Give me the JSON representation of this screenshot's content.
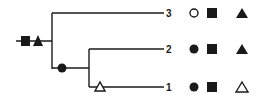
{
  "diagram": {
    "type": "cladogram",
    "colors": {
      "ink": "#1a1a1a",
      "background": "#ffffff"
    },
    "root": {
      "characters": [
        "filled-square",
        "filled-triangle"
      ]
    },
    "internal_node": {
      "characters": [
        "filled-circle"
      ]
    },
    "taxa": [
      {
        "label": "3",
        "branch_marks": [],
        "states": [
          "open-circle",
          "filled-square",
          "filled-triangle"
        ]
      },
      {
        "label": "2",
        "branch_marks": [],
        "states": [
          "filled-circle",
          "filled-square",
          "filled-triangle"
        ]
      },
      {
        "label": "1",
        "branch_marks": [
          "open-triangle"
        ],
        "states": [
          "filled-circle",
          "filled-square",
          "open-triangle"
        ]
      }
    ]
  }
}
